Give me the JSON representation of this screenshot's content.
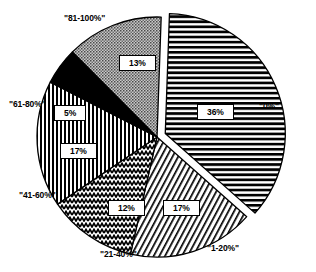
{
  "chart_data": {
    "type": "pie",
    "title": "",
    "subtitle": "",
    "xlabel": "",
    "ylabel": "",
    "legend_position": "none",
    "grid": false,
    "categories": [
      "\"0%\"",
      "\"1-20%\"",
      "\"21-40%\"",
      "\"41-60%\"",
      "\"61-80%\"",
      "\"81-100%\""
    ],
    "values": [
      36,
      17,
      12,
      17,
      5,
      13
    ],
    "value_labels": [
      "36%",
      "17%",
      "12%",
      "17%",
      "5%",
      "13%"
    ],
    "slices": [
      {
        "category": "\"0%\"",
        "value": 36,
        "value_label": "36%",
        "pattern": "horizontal-lines",
        "fill": "#ffffff",
        "stroke": "#000000",
        "exploded": true
      },
      {
        "category": "\"1-20%\"",
        "value": 17,
        "value_label": "17%",
        "pattern": "diagonal-hatch-fine",
        "fill": "#ffffff",
        "stroke": "#000000",
        "exploded": false
      },
      {
        "category": "\"21-40%\"",
        "value": 12,
        "value_label": "12%",
        "pattern": "zigzag-wave",
        "fill": "#ffffff",
        "stroke": "#000000",
        "exploded": false
      },
      {
        "category": "\"41-60%\"",
        "value": 17,
        "value_label": "17%",
        "pattern": "vertical-lines",
        "fill": "#ffffff",
        "stroke": "#000000",
        "exploded": false
      },
      {
        "category": "\"61-80%\"",
        "value": 5,
        "value_label": "5%",
        "pattern": "solid-black",
        "fill": "#000000",
        "stroke": "#000000",
        "exploded": false
      },
      {
        "category": "\"81-100%\"",
        "value": 13,
        "value_label": "13%",
        "pattern": "stipple-dots-gray",
        "fill": "#b8b8b8",
        "stroke": "#000000",
        "exploded": false
      }
    ]
  },
  "colors": {
    "background": "#ffffff",
    "outline": "#000000",
    "text": "#000000",
    "gray_fill": "#b8b8b8",
    "black_fill": "#000000"
  }
}
